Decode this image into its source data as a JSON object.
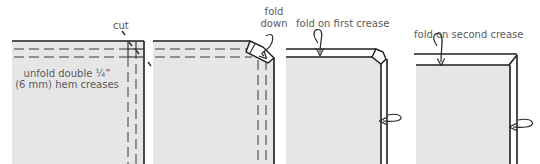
{
  "diagram": {
    "colors": {
      "fabric": "#e6e6e6",
      "line": "#1e1e1e",
      "label": "#5a5a5a",
      "background": "#ffffff"
    },
    "steps": [
      {
        "id": 1,
        "labels": [
          "unfold double ¼”",
          "(6 mm) hem creases"
        ],
        "callout": "cut"
      },
      {
        "id": 2,
        "callout_lines": [
          "fold",
          "down"
        ]
      },
      {
        "id": 3,
        "callout": "fold on first crease"
      },
      {
        "id": 4,
        "callout": "fold on second crease"
      }
    ]
  }
}
